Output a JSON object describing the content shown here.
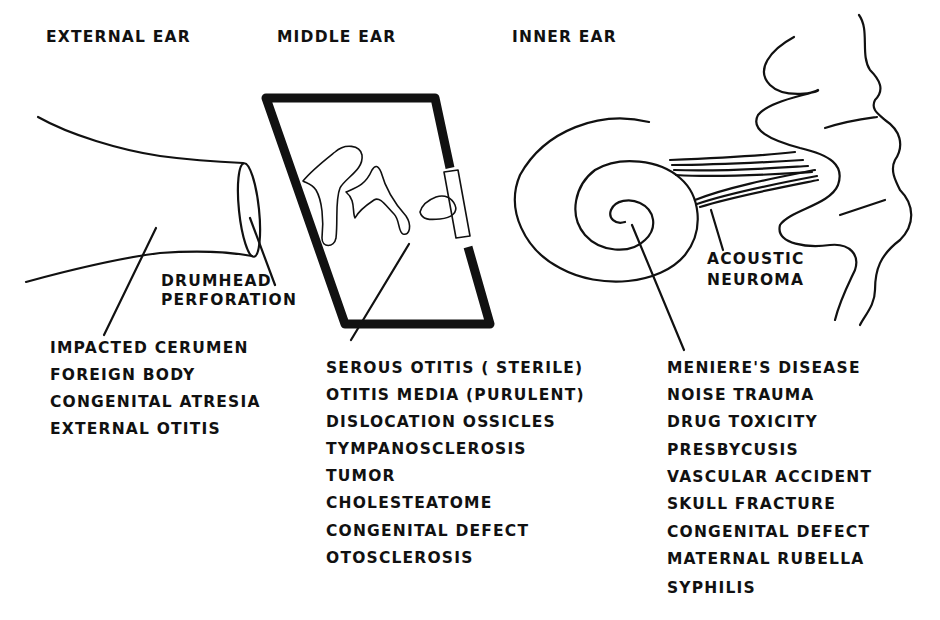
{
  "headers": {
    "external": "EXTERNAL EAR",
    "middle": "MIDDLE EAR",
    "inner": "INNER EAR"
  },
  "callouts": {
    "drumhead_1": "DRUMHEAD",
    "drumhead_2": "PERFORATION",
    "neuroma_1": "ACOUSTIC",
    "neuroma_2": "NEUROMA"
  },
  "lists": {
    "external": [
      "IMPACTED CERUMEN",
      "FOREIGN BODY",
      "CONGENITAL ATRESIA",
      "EXTERNAL OTITIS"
    ],
    "middle": [
      "SEROUS OTITIS ( STERILE)",
      "OTITIS MEDIA (PURULENT)",
      "DISLOCATION OSSICLES",
      "TYMPANOSCLEROSIS",
      "TUMOR",
      "CHOLESTEATOME",
      "CONGENITAL DEFECT",
      "OTOSCLEROSIS"
    ],
    "inner": [
      "MENIERE'S DISEASE",
      "NOISE TRAUMA",
      "DRUG TOXICITY",
      "PRESBYCUSIS",
      "VASCULAR ACCIDENT",
      "SKULL FRACTURE",
      "CONGENITAL DEFECT",
      "MATERNAL RUBELLA",
      "SYPHILIS"
    ]
  },
  "colors": {
    "ink": "#111111",
    "paper": "#ffffff"
  }
}
